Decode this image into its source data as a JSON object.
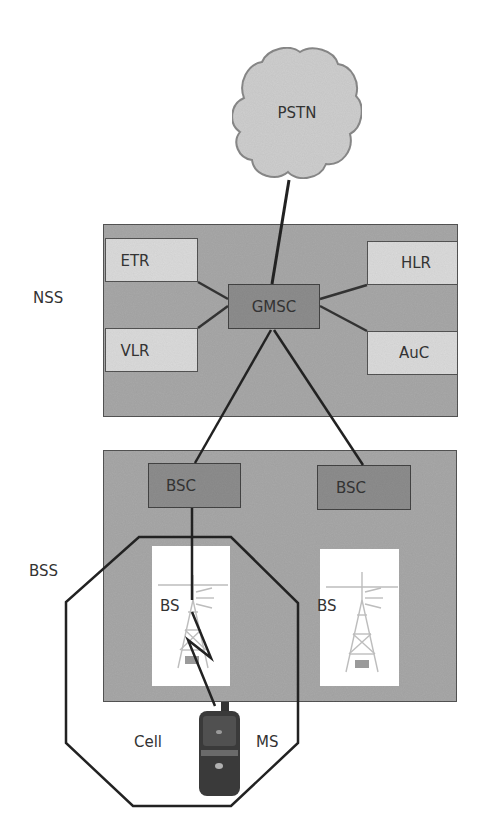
{
  "diagram": {
    "colors": {
      "background": "#ffffff",
      "cloud_fill": "#cfcfcf",
      "cloud_stroke": "#8a8a8a",
      "subsystem_fill": "#a9a9a9",
      "subsystem_stroke": "#555555",
      "register_fill": "#dcdcdc",
      "controller_fill": "#8e8e8e",
      "line": "#222222",
      "label": "#333333"
    },
    "pstn": {
      "label": "PSTN"
    },
    "nss": {
      "label": "NSS",
      "gmsc": {
        "label": "GMSC"
      },
      "registers": [
        {
          "id": "etr",
          "label": "ETR"
        },
        {
          "id": "vlr",
          "label": "VLR"
        },
        {
          "id": "hlr",
          "label": "HLR"
        },
        {
          "id": "auc",
          "label": "AuC"
        }
      ]
    },
    "bss": {
      "label": "BSS",
      "controllers": [
        {
          "id": "bsc-left",
          "label": "BSC"
        },
        {
          "id": "bsc-right",
          "label": "BSC"
        }
      ],
      "base_stations": [
        {
          "id": "bs-left",
          "label": "BS"
        },
        {
          "id": "bs-right",
          "label": "BS"
        }
      ]
    },
    "cell": {
      "label": "Cell"
    },
    "mobile_station": {
      "label": "MS"
    },
    "connections": [
      {
        "from": "PSTN",
        "to": "GMSC"
      },
      {
        "from": "ETR",
        "to": "GMSC"
      },
      {
        "from": "VLR",
        "to": "GMSC"
      },
      {
        "from": "HLR",
        "to": "GMSC"
      },
      {
        "from": "AuC",
        "to": "GMSC"
      },
      {
        "from": "GMSC",
        "to": "BSC (left)"
      },
      {
        "from": "GMSC",
        "to": "BSC (right)"
      },
      {
        "from": "BSC (left)",
        "to": "BS (left)"
      },
      {
        "from": "BS (left)",
        "to": "MS",
        "type": "radio-link"
      }
    ]
  }
}
